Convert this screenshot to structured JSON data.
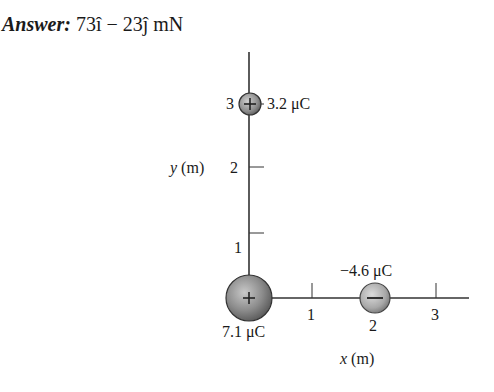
{
  "answer": {
    "label": "Answer:",
    "value": "73î − 23ĵ mN"
  },
  "axes": {
    "x_label_var": "x",
    "x_label_unit": "(m)",
    "y_label_var": "y",
    "y_label_unit": "(m)",
    "x_ticks": [
      "1",
      "2",
      "3"
    ],
    "y_ticks": [
      "1",
      "2",
      "3"
    ]
  },
  "charges": [
    {
      "name": "charge-origin",
      "x": 0,
      "y": 0,
      "sign": "+",
      "label": "7.1 μC",
      "color": "#8a8a8a"
    },
    {
      "name": "charge-top",
      "x": 0,
      "y": 3,
      "sign": "+",
      "label": "3.2 μC",
      "color": "#8a8a8a"
    },
    {
      "name": "charge-right",
      "x": 2,
      "y": 0,
      "sign": "−",
      "label": "−4.6 μC",
      "color": "#a0a0a0"
    }
  ]
}
